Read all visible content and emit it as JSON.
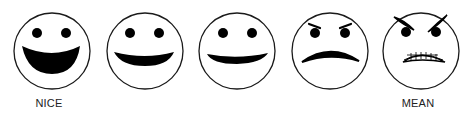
{
  "labels": {
    "left": "NICE",
    "right": "MEAN"
  },
  "faces": [
    {
      "id": "face-1",
      "expression": "big-open-smile",
      "cx": 52
    },
    {
      "id": "face-2",
      "expression": "smile",
      "cx": 145
    },
    {
      "id": "face-3",
      "expression": "slight-smile",
      "cx": 237
    },
    {
      "id": "face-4",
      "expression": "frown-angry-brows",
      "cx": 330
    },
    {
      "id": "face-5",
      "expression": "angry-gritted-teeth",
      "cx": 421
    }
  ],
  "colors": {
    "stroke": "#1a1a1a",
    "fill": "#000000",
    "background": "#ffffff"
  }
}
